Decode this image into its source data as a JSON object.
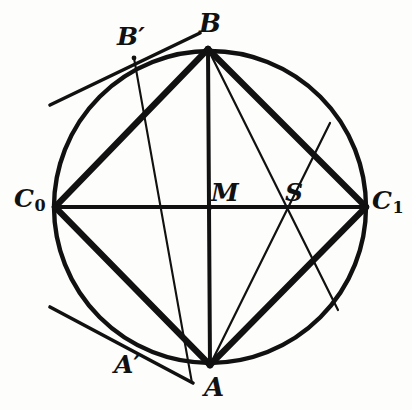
{
  "figure": {
    "type": "geometry-diagram",
    "background": "#fdfdfb",
    "ink_color": "#111111",
    "circle": {
      "cx": 210,
      "cy": 207,
      "r": 156,
      "stroke_width": 4.2
    },
    "points": {
      "B": {
        "x": 208,
        "y": 49,
        "label": "B",
        "on_circle": true
      },
      "A": {
        "x": 210,
        "y": 365,
        "label": "A",
        "on_circle": true
      },
      "C0": {
        "x": 55,
        "y": 207,
        "label": "C",
        "sub": "0",
        "on_circle": true
      },
      "C1": {
        "x": 366,
        "y": 207,
        "label": "C",
        "sub": "1",
        "on_circle": true
      },
      "M": {
        "x": 210,
        "y": 207,
        "label": "M",
        "on_circle": false
      },
      "S": {
        "x": 286,
        "y": 207,
        "label": "S",
        "on_circle": false
      },
      "Bp": {
        "x": 134,
        "y": 60,
        "label": "B",
        "prime": "′",
        "on_circle": true
      },
      "Ap": {
        "x": 142,
        "y": 352,
        "label": "A",
        "prime": "′",
        "on_circle": true
      }
    },
    "thick_segments": [
      {
        "name": "B-C0",
        "from": "B",
        "to": "C0"
      },
      {
        "name": "B-C1",
        "from": "B",
        "to": "C1"
      },
      {
        "name": "A-C0",
        "from": "A",
        "to": "C0"
      },
      {
        "name": "A-C1",
        "from": "A",
        "to": "C1"
      },
      {
        "name": "C0-C1-diameter",
        "from": "C0",
        "to": "C1"
      },
      {
        "name": "B-A-diameter",
        "from": "B",
        "to": "A"
      }
    ],
    "thin_segments": [
      {
        "name": "Bprime-M-Aprime-chord",
        "from": "Bp",
        "to": "Ap"
      },
      {
        "name": "B-S-C1-chord",
        "from": "B",
        "to": "C1"
      },
      {
        "name": "A-S-C1-chord",
        "from": "A",
        "to": "C1"
      }
    ],
    "tangents": [
      {
        "name": "tangent-at-Bprime",
        "x1": 50,
        "y1": 105,
        "x2": 200,
        "y2": 33
      },
      {
        "name": "tangent-at-Aprime",
        "x1": 50,
        "y1": 307,
        "x2": 193,
        "y2": 383
      }
    ]
  },
  "labels": {
    "B": "B",
    "Bprime": "B′",
    "C0_base": "C",
    "C0_sub": "0",
    "C1_base": "C",
    "C1_sub": "1",
    "M": "M",
    "S": "S",
    "A": "A",
    "Aprime": "A′"
  }
}
